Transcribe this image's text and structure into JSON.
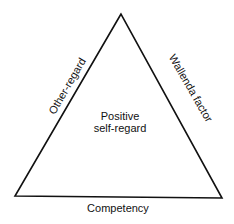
{
  "diagram": {
    "type": "triangle",
    "center_label_line1": "Positive",
    "center_label_line2": "self-regard",
    "left_side_label": "Other-regard",
    "right_side_label": "Wallenda factor",
    "bottom_side_label": "Competency",
    "stroke_color": "#111111"
  }
}
